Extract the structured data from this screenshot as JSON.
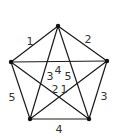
{
  "diagram": {
    "type": "complete-graph-K5",
    "line_color": "#1a1a1a",
    "vertex_color": "#111111",
    "label_color": "#333333",
    "vertices": [
      {
        "id": "top",
        "x": 58,
        "y": 26
      },
      {
        "id": "right",
        "x": 107,
        "y": 61
      },
      {
        "id": "bottom-right",
        "x": 89,
        "y": 119
      },
      {
        "id": "bottom-left",
        "x": 30,
        "y": 119
      },
      {
        "id": "left",
        "x": 11,
        "y": 62
      }
    ],
    "edges": [
      {
        "from": "top",
        "to": "left"
      },
      {
        "from": "top",
        "to": "right"
      },
      {
        "from": "right",
        "to": "bottom-right"
      },
      {
        "from": "bottom-right",
        "to": "bottom-left"
      },
      {
        "from": "bottom-left",
        "to": "left"
      },
      {
        "from": "left",
        "to": "right"
      },
      {
        "from": "top",
        "to": "bottom-left"
      },
      {
        "from": "top",
        "to": "bottom-right"
      },
      {
        "from": "left",
        "to": "bottom-right"
      },
      {
        "from": "right",
        "to": "bottom-left"
      }
    ],
    "labels": {
      "outer_top_left": "1",
      "outer_top_right": "2",
      "outer_right": "3",
      "outer_bottom": "4",
      "outer_left": "5",
      "inner_top": "4",
      "inner_left": "3",
      "inner_right": "5",
      "inner_bottom_left": "2",
      "inner_bottom_right": "1"
    }
  }
}
